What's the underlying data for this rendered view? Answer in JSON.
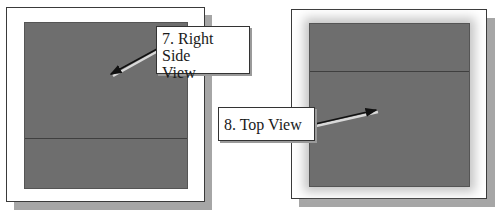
{
  "panels": [
    {
      "name": "right-side-view-panel",
      "callout": {
        "label_line1": "7. Right Side",
        "label_line2": "View"
      }
    },
    {
      "name": "top-view-panel",
      "callout": {
        "label": "8. Top View"
      }
    }
  ],
  "colors": {
    "viewport": "#6e6e6e",
    "frame": "#ffffff",
    "shadow": "#a6a6a6",
    "edge_line": "#3f3f3f"
  }
}
